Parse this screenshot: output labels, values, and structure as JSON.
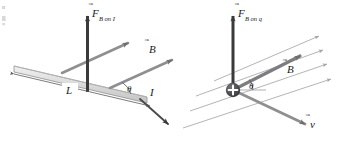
{
  "figure": {
    "type": "physics-vector-diagram-pair",
    "background_color": "#ffffff",
    "ink_color": "#58585a",
    "dark_ink_color": "#3a3a3c",
    "bar_fill_color": "#d9d9d9",
    "bar_edge_color": "#8c8c8c",
    "field_line_color": "#a6a6a8"
  },
  "margin_scraps": {
    "present": true,
    "description": "clipped text fragments at extreme left edge of page",
    "fragments": [
      "s",
      "d"
    ]
  },
  "left_panel": {
    "name": "force-on-current-carrying-wire",
    "labels": {
      "force_symbol": "F",
      "force_vector_accent": "⃗",
      "force_subscript": "B on I",
      "field_symbol": "B",
      "field_vector_accent": "⃗",
      "length_label": "L",
      "angle_label": "θ",
      "current_label": "I"
    },
    "elements": {
      "rod": "shaded-parallelogram-bar",
      "force_arrow_direction": "up",
      "field_arrows_count": 2,
      "current_arrow_direction": "down-right",
      "dimension_line": "double-headed-arrow-under-rod"
    }
  },
  "right_panel": {
    "name": "force-on-moving-point-charge",
    "labels": {
      "force_symbol": "F",
      "force_vector_accent": "⃗",
      "force_subscript": "B on q",
      "field_symbol": "B",
      "field_vector_accent": "⃗",
      "velocity_symbol": "v",
      "velocity_vector_accent": "⃗",
      "angle_label": "θ",
      "charge_sign": "+"
    },
    "elements": {
      "charge": "filled-circle-with-plus",
      "force_arrow_direction": "up",
      "field_lines_count": 4,
      "field_vector": "thick-arrow-up-right",
      "velocity_arrow_direction": "down-right"
    }
  }
}
